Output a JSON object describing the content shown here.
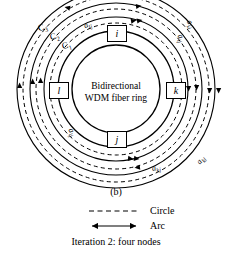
{
  "figure": {
    "center_text_line1": "Bidirectional",
    "center_text_line2": "WDM fiber ring",
    "nodes": [
      {
        "id": "node-i",
        "label": "i",
        "position": "top"
      },
      {
        "id": "node-k",
        "label": "k",
        "position": "right"
      },
      {
        "id": "node-j",
        "label": "j",
        "position": "bottom"
      },
      {
        "id": "node-l",
        "label": "l",
        "position": "left"
      }
    ],
    "arc_labels": [
      {
        "name": "arc-label-a-lj-top",
        "base": "a",
        "sub": "lj"
      },
      {
        "name": "arc-label-a-ki",
        "base": "a",
        "sub": "ki"
      },
      {
        "name": "arc-label-a-ij",
        "base": "a",
        "sub": "ij"
      },
      {
        "name": "arc-label-a-lj-bottom",
        "base": "a",
        "sub": "lj"
      },
      {
        "name": "arc-label-a-kj",
        "base": "a",
        "sub": "kj"
      },
      {
        "name": "arc-label-a-kl",
        "base": "a",
        "sub": "kl"
      }
    ],
    "circle_labels": [
      {
        "name": "circle-label-c3",
        "base": "C",
        "sub": "3"
      },
      {
        "name": "circle-label-c2",
        "base": "C",
        "sub": "2"
      },
      {
        "name": "circle-label-c1",
        "base": "C",
        "sub": "1"
      }
    ]
  },
  "caption": {
    "panel": "(b)",
    "iteration": "Iteration 2: four nodes"
  },
  "legend": {
    "circle_label": "Circle",
    "arc_label": "Arc"
  },
  "colors": {
    "stroke": "#000000",
    "background": "#ffffff"
  }
}
